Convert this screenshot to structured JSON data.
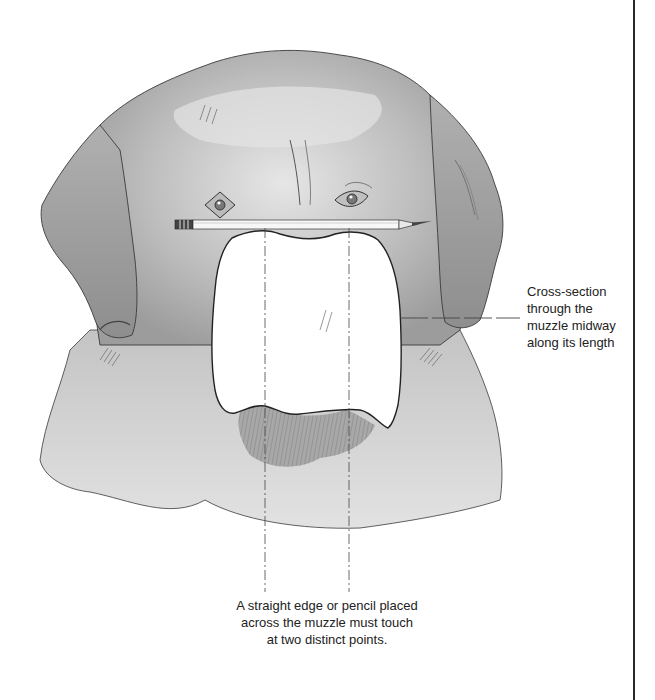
{
  "figure": {
    "colors": {
      "background": "#ffffff",
      "shading_dark": "#8a8a8a",
      "shading_mid": "#b5b5b5",
      "shading_light": "#d9d9d9",
      "outline": "#3a3a3a",
      "rule": "#2a2a2a"
    }
  },
  "annotations": {
    "cross_section": {
      "lines": [
        "Cross-section",
        "through the",
        "muzzle midway",
        "along its length"
      ]
    },
    "straight_edge": {
      "lines": [
        "A straight edge or pencil placed",
        "across the muzzle must touch",
        "at two distinct points."
      ]
    }
  },
  "icons": {
    "pencil": "pencil-icon"
  }
}
